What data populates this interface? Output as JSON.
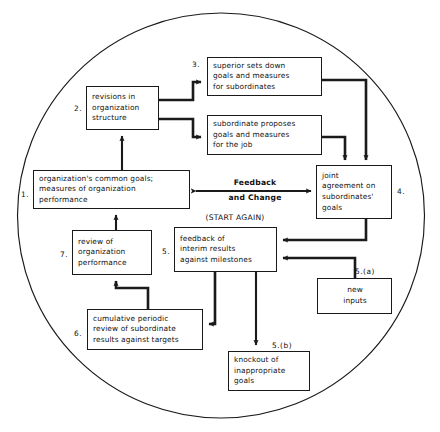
{
  "diagram": {
    "shape": "circle",
    "line_color": "#1a1a1a",
    "background": "#ffffff",
    "nodes": [
      {
        "tag": "1.",
        "text": "organization's common goals;\nmeasures of organization\nperformance"
      },
      {
        "tag": "2.",
        "text": "revisions in\norganization\nstructure"
      },
      {
        "tag": "3.",
        "text": "superior sets down\ngoals and measures\nfor subordinates"
      },
      {
        "tag": "",
        "text": "subordinate proposes\ngoals and measures\nfor the job"
      },
      {
        "tag": "4.",
        "text": "joint\nagreement on\nsubordinates'\ngoals"
      },
      {
        "tag": "5.",
        "text": "feedback of\ninterim results\nagainst milestones"
      },
      {
        "tag": "5.(a)",
        "text": "new\ninputs"
      },
      {
        "tag": "5.(b)",
        "text": "knockout of\ninappropriate\ngoals"
      },
      {
        "tag": "6.",
        "text": "cumulative periodic\nreview of subordinate\nresults against targets"
      },
      {
        "tag": "7.",
        "text": "review of\norganization\nperformance"
      }
    ],
    "labels": {
      "feedback_line1": "Feedback",
      "feedback_line2": "and Change",
      "start_again": "(START AGAIN)"
    }
  }
}
